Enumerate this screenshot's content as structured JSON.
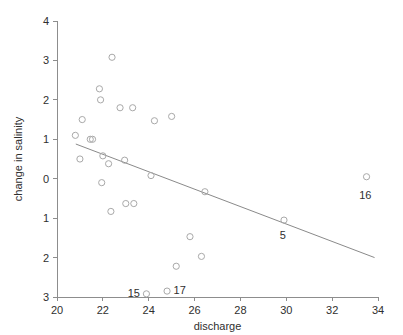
{
  "chart_data": {
    "type": "scatter",
    "title": "",
    "xlabel": "discharge",
    "ylabel": "change in salinity",
    "xlim": [
      20,
      34
    ],
    "ylim": [
      -3,
      4
    ],
    "xticks": [
      20,
      22,
      24,
      26,
      28,
      30,
      32,
      34
    ],
    "xticklabels": [
      "20",
      "22",
      "24",
      "26",
      "28",
      "30",
      "32",
      "34"
    ],
    "yticks": [
      4,
      3,
      2,
      1,
      0,
      -1,
      -2,
      -3
    ],
    "yticklabels": [
      "4",
      "3",
      "2",
      "1",
      "0",
      "1",
      "2",
      "3"
    ],
    "grid": false,
    "legend": null,
    "marker_style": "open-circle",
    "points": [
      {
        "x": 20.8,
        "y": 1.1
      },
      {
        "x": 21.0,
        "y": 0.5
      },
      {
        "x": 21.1,
        "y": 1.5
      },
      {
        "x": 21.45,
        "y": 1.0
      },
      {
        "x": 21.55,
        "y": 1.0
      },
      {
        "x": 21.85,
        "y": 2.28
      },
      {
        "x": 21.9,
        "y": 2.0
      },
      {
        "x": 21.95,
        "y": -0.1
      },
      {
        "x": 22.0,
        "y": 0.58
      },
      {
        "x": 22.25,
        "y": 0.38
      },
      {
        "x": 22.35,
        "y": -0.83
      },
      {
        "x": 22.4,
        "y": 3.08
      },
      {
        "x": 22.75,
        "y": 1.8
      },
      {
        "x": 22.95,
        "y": 0.47
      },
      {
        "x": 23.0,
        "y": -0.63
      },
      {
        "x": 23.3,
        "y": 1.8
      },
      {
        "x": 23.35,
        "y": -0.63
      },
      {
        "x": 23.9,
        "y": -2.92
      },
      {
        "x": 24.1,
        "y": 0.08
      },
      {
        "x": 24.25,
        "y": 1.47
      },
      {
        "x": 24.8,
        "y": -2.85
      },
      {
        "x": 25.0,
        "y": 1.58
      },
      {
        "x": 25.2,
        "y": -2.22
      },
      {
        "x": 25.8,
        "y": -1.47
      },
      {
        "x": 26.3,
        "y": -1.97
      },
      {
        "x": 26.45,
        "y": -0.33
      },
      {
        "x": 29.9,
        "y": -1.05
      },
      {
        "x": 33.5,
        "y": 0.05
      }
    ],
    "annotations": [
      {
        "label": "15",
        "x": 23.35,
        "y": -2.9
      },
      {
        "label": "17",
        "x": 25.35,
        "y": -2.83
      },
      {
        "label": "5",
        "x": 29.85,
        "y": -1.42
      },
      {
        "label": "16",
        "x": 33.45,
        "y": -0.42
      }
    ],
    "fit_line": {
      "x_start": 20.82,
      "y_start": 0.88,
      "x_end": 33.85,
      "y_end": -2.0
    }
  }
}
